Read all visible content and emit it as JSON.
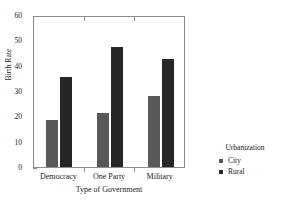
{
  "chart_data": {
    "type": "bar",
    "title": "",
    "xlabel": "Type of Government",
    "ylabel": "Birth Rate",
    "categories": [
      "Democracy",
      "One Party",
      "Military"
    ],
    "series": [
      {
        "name": "City",
        "values": [
          18.4,
          21.3,
          28.1
        ],
        "color": "#595959"
      },
      {
        "name": "Rural",
        "values": [
          35.4,
          47.4,
          42.5
        ],
        "color": "#262626"
      }
    ],
    "ylim": [
      0,
      60
    ],
    "yticks": [
      0,
      10,
      20,
      30,
      40,
      50,
      60
    ],
    "ytick_labels": [
      "0",
      "10",
      "20",
      "30",
      "40",
      "50",
      "60"
    ],
    "grid": false,
    "legend": {
      "title": "Urbanization",
      "position": "right",
      "entries": [
        {
          "label": "City",
          "color": "#595959"
        },
        {
          "label": "Rural",
          "color": "#262626"
        }
      ]
    },
    "axis_color": "#8c8c8c",
    "background": "#ffffff"
  }
}
